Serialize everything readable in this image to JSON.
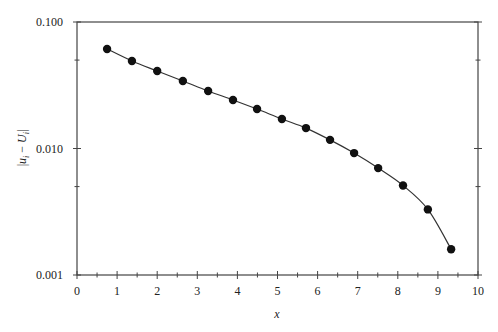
{
  "chart_data": {
    "type": "line",
    "title": "",
    "xlabel": "x",
    "ylabel": "|u_i − U_i|",
    "ylabel_parts": {
      "open": "|",
      "u": "u",
      "u_sub": "i",
      "minus": " − ",
      "U": "U",
      "U_sub": "i",
      "close": "|"
    },
    "xlim": [
      0,
      10
    ],
    "ylim": [
      0.001,
      0.1
    ],
    "yscale": "log",
    "grid": false,
    "legend": null,
    "x_ticks": [
      0,
      1,
      2,
      3,
      4,
      5,
      6,
      7,
      8,
      9,
      10
    ],
    "x_tick_labels": [
      "0",
      "1",
      "2",
      "3",
      "4",
      "5",
      "6",
      "7",
      "8",
      "9",
      "10"
    ],
    "x_minor_ticks": [
      0.5,
      1.5,
      2.5,
      3.5,
      4.5,
      5.5,
      6.5,
      7.5,
      8.5,
      9.5
    ],
    "y_ticks": [
      0.001,
      0.01,
      0.1
    ],
    "y_tick_labels": [
      "0.001",
      "0.010",
      "0.100"
    ],
    "y_minor_ticks": [
      0.005,
      0.05
    ],
    "series": [
      {
        "name": "error",
        "marker": "filled-circle",
        "line": "solid",
        "color": "#111111",
        "x": [
          0.75,
          1.37,
          2.0,
          2.64,
          3.27,
          3.89,
          4.49,
          5.11,
          5.71,
          6.31,
          6.91,
          7.51,
          8.13,
          8.75,
          9.33
        ],
        "values": [
          0.0612,
          0.0492,
          0.041,
          0.0342,
          0.0285,
          0.0242,
          0.0205,
          0.0171,
          0.0145,
          0.0117,
          0.0092,
          0.007,
          0.0051,
          0.0033,
          0.0016
        ]
      }
    ]
  }
}
